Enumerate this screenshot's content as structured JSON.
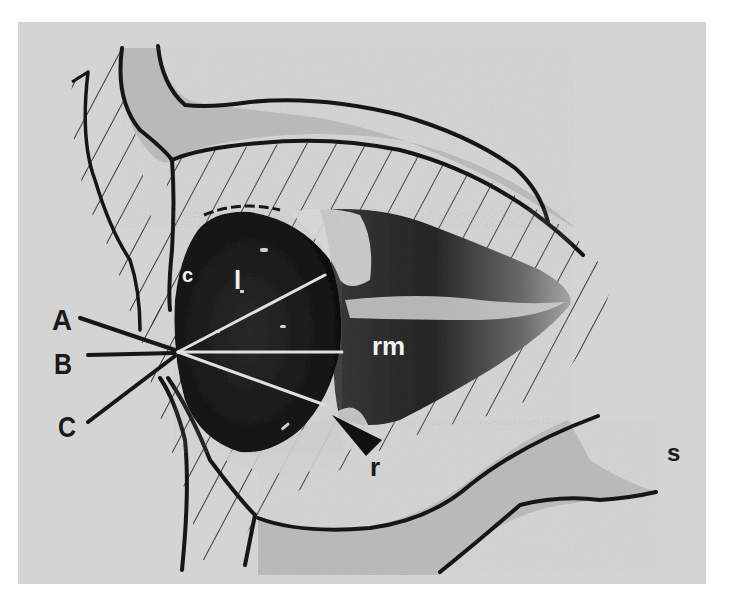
{
  "figure": {
    "colors": {
      "background_panel": "#d4d4d4",
      "page": "#ffffff",
      "outline": "#161616",
      "bone_fill": "#bdbdbd",
      "hatch": "#3a3a3a",
      "globe_dark": "#1b1b1b",
      "muscle_mid": "#6e6e6e",
      "axis_line_light": "#d8d8d8"
    },
    "axis_labels": {
      "A": "A",
      "B": "B",
      "C": "C"
    },
    "structure_labels": {
      "cornea": "c",
      "lens": "l",
      "rectus_muscle": "rm",
      "retina_pointer": "r",
      "sinus": "s"
    }
  }
}
